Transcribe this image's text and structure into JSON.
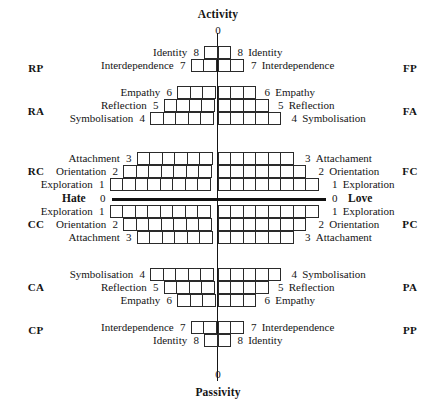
{
  "figure": {
    "axes": {
      "vertical_top": "Activity",
      "vertical_bottom": "Passivity",
      "horizontal_left": "Hate",
      "horizontal_right": "Love",
      "zero_top": "0",
      "zero_bottom": "0",
      "zero_left": "0",
      "zero_right": "0"
    },
    "quadrant_codes_left": [
      "RP",
      "RA",
      "RC",
      "CC",
      "CA",
      "CP"
    ],
    "quadrant_codes_right": [
      "FP",
      "FA",
      "FC",
      "PC",
      "PA",
      "PP"
    ],
    "rows": [
      {
        "level": "8",
        "label_left": "Identity",
        "label_right": "Identity",
        "cells_per_side": 1
      },
      {
        "level": "7",
        "label_left": "Interdependence",
        "label_right": "Interdependence",
        "cells_per_side": 2
      },
      {
        "level": "6",
        "label_left": "Empathy",
        "label_right": "Empathy",
        "cells_per_side": 3
      },
      {
        "level": "5",
        "label_left": "Reflection",
        "label_right": "Reflection",
        "cells_per_side": 4
      },
      {
        "level": "4",
        "label_left": "Symbolisation",
        "label_right": "Symbolisation",
        "cells_per_side": 5
      },
      {
        "level": "3",
        "label_left": "Attachment",
        "label_right": "Attachament",
        "cells_per_side": 6
      },
      {
        "level": "2",
        "label_left": "Orientation",
        "label_right": "Orientation",
        "cells_per_side": 7
      },
      {
        "level": "1",
        "label_left": "Exploration",
        "label_right": "Exploration",
        "cells_per_side": 8
      },
      {
        "level": "1",
        "label_left": "Exploration",
        "label_right": "Exploration",
        "cells_per_side": 8
      },
      {
        "level": "2",
        "label_left": "Orientation",
        "label_right": "Orientation",
        "cells_per_side": 7
      },
      {
        "level": "3",
        "label_left": "Attachment",
        "label_right": "Attachament",
        "cells_per_side": 6
      },
      {
        "level": "4",
        "label_left": "Symbolisation",
        "label_right": "Symbolisation",
        "cells_per_side": 5
      },
      {
        "level": "5",
        "label_left": "Reflection",
        "label_right": "Reflection",
        "cells_per_side": 4
      },
      {
        "level": "6",
        "label_left": "Empathy",
        "label_right": "Empathy",
        "cells_per_side": 3
      },
      {
        "level": "7",
        "label_left": "Interdependence",
        "label_right": "Interdependence",
        "cells_per_side": 2
      },
      {
        "level": "8",
        "label_left": "Identity",
        "label_right": "Identity",
        "cells_per_side": 1
      }
    ],
    "colors": {
      "line": "#2a2a2a",
      "axis": "#111111",
      "background": "#ffffff"
    }
  }
}
